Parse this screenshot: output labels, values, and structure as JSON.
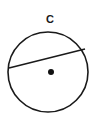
{
  "diagram": {
    "circle_label": "C",
    "circle": {
      "cx": 48,
      "cy": 72,
      "r": 40,
      "stroke": "#1a1a1a"
    },
    "chord": {
      "x1": 9,
      "y1": 68,
      "x2": 85,
      "y2": 49
    },
    "center_point": {
      "cx": 51,
      "cy": 72,
      "r": 3
    }
  }
}
